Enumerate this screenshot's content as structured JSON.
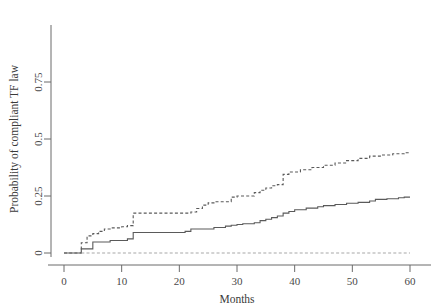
{
  "chart_data": {
    "type": "line",
    "title": "",
    "subtitle": "",
    "xlabel": "Months",
    "ylabel": "Probability of compliant TF law",
    "xlim": [
      0,
      62
    ],
    "ylim": [
      0,
      1.0
    ],
    "xticks": [
      0,
      10,
      20,
      30,
      40,
      50,
      60
    ],
    "xtick_labels": [
      "0",
      "10",
      "20",
      "30",
      "40",
      "50",
      "60"
    ],
    "yticks": [
      0,
      0.25,
      0.5,
      0.75
    ],
    "ytick_labels": [
      "0",
      "0.25",
      "0.5",
      "0.75"
    ],
    "grid": false,
    "legend_position": "none",
    "line_color": "#5a5a5a",
    "axis_color": "#6b6b6b",
    "series": [
      {
        "name": "upper-dashed-curve",
        "style": "dashed",
        "color": "#5a5a5a",
        "x": [
          0,
          3,
          3,
          4,
          4,
          5,
          5,
          6,
          6,
          7,
          7,
          8,
          8,
          10,
          10,
          11,
          11,
          12,
          12,
          22,
          22,
          23,
          23,
          24,
          24,
          25,
          25,
          26,
          26,
          29,
          29,
          30,
          30,
          33,
          33,
          34,
          34,
          35,
          35,
          36,
          36,
          37,
          37,
          38,
          38,
          39,
          39,
          41,
          41,
          43,
          43,
          45,
          45,
          47,
          47,
          49,
          49,
          51,
          51,
          53,
          53,
          55,
          55,
          57,
          57,
          59,
          59,
          60
        ],
        "y": [
          0,
          0,
          0.045,
          0.045,
          0.075,
          0.075,
          0.085,
          0.085,
          0.095,
          0.095,
          0.105,
          0.105,
          0.11,
          0.11,
          0.115,
          0.115,
          0.12,
          0.12,
          0.175,
          0.175,
          0.18,
          0.18,
          0.195,
          0.195,
          0.21,
          0.21,
          0.22,
          0.22,
          0.225,
          0.225,
          0.245,
          0.245,
          0.25,
          0.25,
          0.265,
          0.265,
          0.275,
          0.275,
          0.285,
          0.285,
          0.295,
          0.295,
          0.3,
          0.3,
          0.345,
          0.345,
          0.355,
          0.355,
          0.365,
          0.365,
          0.375,
          0.375,
          0.385,
          0.385,
          0.395,
          0.395,
          0.405,
          0.405,
          0.415,
          0.415,
          0.425,
          0.425,
          0.43,
          0.43,
          0.435,
          0.435,
          0.44,
          0.44
        ]
      },
      {
        "name": "middle-solid-curve",
        "style": "solid",
        "color": "#5a5a5a",
        "x": [
          0,
          3,
          3,
          5,
          5,
          8,
          8,
          11,
          11,
          12,
          12,
          21,
          21,
          22,
          22,
          26,
          26,
          28,
          28,
          29,
          29,
          30,
          30,
          31,
          31,
          33,
          33,
          34,
          34,
          35,
          35,
          36,
          36,
          37,
          37,
          38,
          38,
          39,
          39,
          40,
          40,
          42,
          42,
          44,
          44,
          45,
          45,
          47,
          47,
          49,
          49,
          51,
          51,
          53,
          53,
          54,
          54,
          56,
          56,
          58,
          58,
          59,
          59,
          60
        ],
        "y": [
          0,
          0,
          0.018,
          0.018,
          0.048,
          0.048,
          0.055,
          0.055,
          0.062,
          0.062,
          0.09,
          0.09,
          0.095,
          0.095,
          0.105,
          0.105,
          0.112,
          0.112,
          0.118,
          0.118,
          0.122,
          0.122,
          0.125,
          0.125,
          0.128,
          0.128,
          0.133,
          0.133,
          0.142,
          0.142,
          0.148,
          0.148,
          0.155,
          0.155,
          0.162,
          0.162,
          0.175,
          0.175,
          0.182,
          0.182,
          0.19,
          0.19,
          0.197,
          0.197,
          0.203,
          0.203,
          0.208,
          0.208,
          0.213,
          0.213,
          0.218,
          0.218,
          0.222,
          0.222,
          0.228,
          0.228,
          0.235,
          0.235,
          0.238,
          0.238,
          0.242,
          0.242,
          0.245,
          0.245
        ]
      },
      {
        "name": "baseline-dashed-curve",
        "style": "dashed",
        "color": "#a8a8a8",
        "x": [
          3,
          60
        ],
        "y": [
          0,
          0
        ]
      }
    ]
  }
}
